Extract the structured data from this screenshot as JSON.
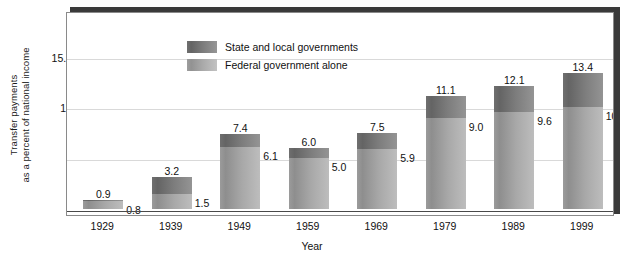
{
  "chart_data": {
    "type": "bar",
    "subtype": "stacked-bar",
    "title": "",
    "xlabel": "Year",
    "ylabel": "Transfer payments as a percent of national income",
    "ylabel_line1": "Transfer payments",
    "ylabel_line2": "as a percent of national income",
    "categories": [
      "1929",
      "1939",
      "1949",
      "1959",
      "1969",
      "1979",
      "1989",
      "1999"
    ],
    "series": [
      {
        "name": "Federal government alone",
        "values": [
          0.8,
          1.5,
          6.1,
          5.0,
          5.9,
          9.0,
          9.6,
          10.0
        ],
        "color": "#a3a3a3"
      },
      {
        "name": "State and local governments",
        "values": [
          0.1,
          1.7,
          1.3,
          1.0,
          1.6,
          2.1,
          2.5,
          3.4
        ],
        "color": "#727272",
        "note": "plotted as the remainder up to the total"
      }
    ],
    "totals": [
      0.9,
      3.2,
      7.4,
      6.0,
      7.5,
      11.1,
      12.1,
      13.4
    ],
    "total_labels": [
      "0.9",
      "3.2",
      "7.4",
      "6.0",
      "7.5",
      "11.1",
      "12.1",
      "13.4"
    ],
    "federal_labels": [
      "0.8",
      "1.5",
      "6.1",
      "5.0",
      "5.9",
      "9.0",
      "9.6",
      "10.0"
    ],
    "yticks": [
      5,
      10,
      15
    ],
    "ytick_labels": [
      "5",
      "10",
      "15.0"
    ],
    "ylim": [
      0,
      19.5
    ],
    "grid": true,
    "legend_position": "inside-top-left"
  },
  "legend": {
    "items": [
      {
        "label": "State and local governments",
        "swatch": "state"
      },
      {
        "label": "Federal government alone",
        "swatch": "federal"
      }
    ]
  },
  "axes": {
    "x_title": "Year",
    "y_title_line1": "Transfer payments",
    "y_title_line2": "as a percent of national income"
  }
}
